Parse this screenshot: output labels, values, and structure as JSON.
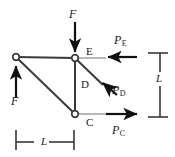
{
  "figure": {
    "background_color": "#ffffff",
    "line_color": "#3a3a3a",
    "arrow_color": "#111111",
    "text_color": "#1a1a1a",
    "width": 175,
    "height": 157
  },
  "nodes": [
    {
      "id": "A",
      "label": "",
      "x": 16,
      "y": 57,
      "type": "open-circle"
    },
    {
      "id": "E",
      "label": "E",
      "x": 75,
      "y": 58,
      "type": "open-circle"
    },
    {
      "id": "C",
      "label": "C",
      "x": 75,
      "y": 114,
      "type": "open-circle"
    }
  ],
  "members": [
    {
      "name": "top-chord",
      "from": "A",
      "to": "E"
    },
    {
      "name": "diagonal-chord",
      "from": "A",
      "to": "C"
    },
    {
      "name": "vertical-chord",
      "from": "E",
      "to": "C"
    },
    {
      "name": "member-D-stub",
      "from": "E",
      "to": "D-point"
    }
  ],
  "member_labels": [
    {
      "name": "member-label-D",
      "text": "D",
      "x": 81,
      "y": 79
    }
  ],
  "node_labels": [
    {
      "name": "node-label-E",
      "text": "E",
      "x": 86,
      "y": 46
    },
    {
      "name": "node-label-C",
      "text": "C",
      "x": 86,
      "y": 117
    }
  ],
  "forces": [
    {
      "name": "force-F-top",
      "label": "F",
      "direction": "down",
      "label_x": 69,
      "label_y": 8
    },
    {
      "name": "force-F-left",
      "label": "F",
      "direction": "up",
      "label_x": 11,
      "label_y": 95
    },
    {
      "name": "force-PE",
      "label": "P",
      "subscript": "E",
      "direction": "left",
      "label_x": 114,
      "label_y": 34
    },
    {
      "name": "force-PD",
      "label": "P",
      "subscript": "D",
      "direction": "up-left",
      "label_x": 112,
      "label_y": 84
    },
    {
      "name": "force-PC",
      "label": "P",
      "subscript": "C",
      "direction": "right",
      "label_x": 112,
      "label_y": 124
    }
  ],
  "dimensions": [
    {
      "name": "dimension-horizontal-L",
      "label": "L",
      "orientation": "horizontal",
      "label_x": 41,
      "label_y": 136
    },
    {
      "name": "dimension-vertical-L",
      "label": "L",
      "orientation": "vertical",
      "label_x": 158,
      "label_y": 79
    }
  ]
}
